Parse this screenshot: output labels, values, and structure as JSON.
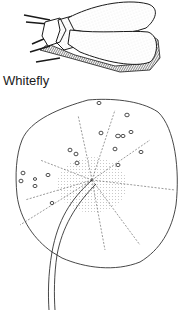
{
  "figure": {
    "caption": "Whitefly",
    "subjects": [
      {
        "name": "whitefly",
        "description": "adult whitefly, side view, wings folded"
      },
      {
        "name": "leaf",
        "description": "rounded leaf with stem, underside showing whitefly nymphs/eggs clustered near veins"
      }
    ]
  },
  "colors": {
    "ink": "#1a1a1a",
    "background": "#ffffff"
  }
}
